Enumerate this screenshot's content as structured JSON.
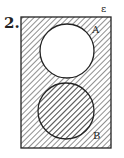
{
  "question_number": "2.",
  "universal_label": "ε",
  "sets": [
    {
      "label": "A",
      "shaded": false
    },
    {
      "label": "B",
      "shaded": true
    }
  ],
  "shaded_region": "complement of A (ε \\ A)",
  "colors": {
    "stroke": "#222222",
    "hatch": "#333333",
    "background": "#ffffff"
  }
}
